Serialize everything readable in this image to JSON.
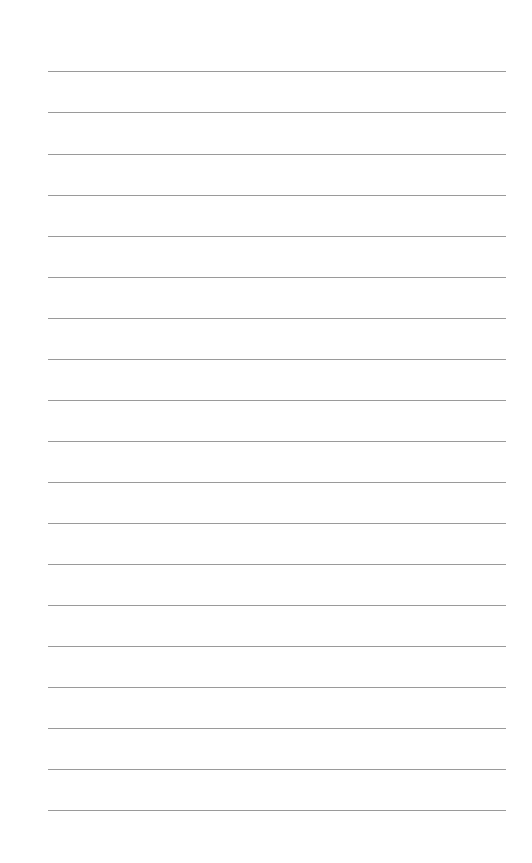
{
  "page": {
    "type": "blank-lined-paper",
    "background": "#ffffff",
    "rule_color": "#9a9a9a",
    "rule_left": 48,
    "rule_width": 458,
    "rules_y": [
      71,
      112,
      154,
      195,
      236,
      277,
      318,
      359,
      400,
      441,
      482,
      523,
      564,
      605,
      646,
      687,
      728,
      769,
      810
    ]
  }
}
